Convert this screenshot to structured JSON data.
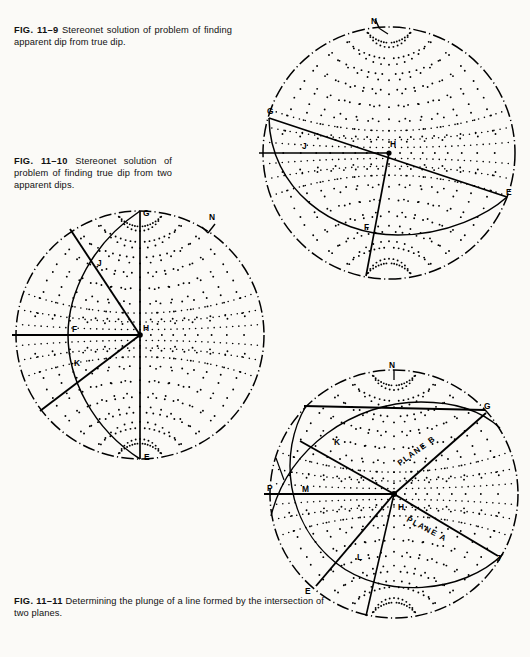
{
  "page": {
    "background": "#fbfaf7",
    "ink": "#111111",
    "width": 530,
    "height": 657
  },
  "captions": [
    {
      "id": "cap-11-9",
      "figure_number": "FIG. 11–9",
      "text": "Stereonet solution of problem of finding apparent dip from true dip."
    },
    {
      "id": "cap-11-10",
      "figure_number": "FIG. 11–10",
      "text": "Stereonet solution of problem of finding true dip from two apparent dips."
    },
    {
      "id": "cap-11-11",
      "figure_number": "FIG. 11–11",
      "text": "Determining the plunge of a line formed by the intersection of two planes."
    }
  ],
  "figures": [
    {
      "id": "net-top",
      "name": "stereonet-apparent-dip",
      "caption_ref": "FIG. 11–9",
      "compass_label": "N",
      "point_labels": [
        "G",
        "J",
        "H",
        "E",
        "F"
      ],
      "description": "Wulff stereonet with great circle from G through F to E, radius H-J horizontal, and line H-F plotted."
    },
    {
      "id": "net-mid",
      "name": "stereonet-true-dip",
      "caption_ref": "FIG. 11–10",
      "compass_label": "N",
      "point_labels": [
        "G",
        "J",
        "F",
        "H",
        "K",
        "E"
      ],
      "description": "Wulff stereonet with vertical diameter G-E, horizontal radius F-H, great circle through G, J, K, E and two apparent dip rays."
    },
    {
      "id": "net-bot",
      "name": "stereonet-plane-intersection",
      "caption_ref": "FIG. 11–11",
      "compass_label": "N",
      "point_labels": [
        "G",
        "K",
        "P",
        "M",
        "H",
        "L",
        "E",
        "J"
      ],
      "plane_labels": [
        "PLANE A",
        "PLANE B"
      ],
      "description": "Wulff stereonet showing two intersecting great circles (Plane A and Plane B) and the plunge of their line of intersection."
    }
  ],
  "chart_data": {
    "type": "scatter",
    "projection": "lower-hemisphere equal-angle",
    "grid": "polar great-circle / small-circle net, 10° spacing, rendered as dotted lattice",
    "legend_position": "none",
    "nets": [
      {
        "id": "net-top",
        "center": [
          131,
          139
        ],
        "radius": 126,
        "primitive": "dash-dot circle",
        "labels": [
          {
            "text": "N",
            "angle_deg": -27,
            "note": "north tick on primitive, upper-left"
          },
          {
            "text": "G",
            "x": 12,
            "y": 100
          },
          {
            "text": "J",
            "x": 48,
            "y": 137
          },
          {
            "text": "H",
            "x": 133,
            "y": 134
          },
          {
            "text": "E",
            "x": 249,
            "y": 182
          },
          {
            "text": "F",
            "x": 112,
            "y": 218
          }
        ]
      },
      {
        "id": "net-mid",
        "center": [
          128,
          137
        ],
        "radius": 124,
        "primitive": "dash-dot circle",
        "labels": [
          {
            "text": "G",
            "x": 130,
            "y": 16
          },
          {
            "text": "N",
            "x": 196,
            "y": 20
          },
          {
            "text": "J",
            "x": 90,
            "y": 66
          },
          {
            "text": "F",
            "x": 63,
            "y": 131
          },
          {
            "text": "H",
            "x": 132,
            "y": 129
          },
          {
            "text": "K",
            "x": 65,
            "y": 165
          },
          {
            "text": "E",
            "x": 131,
            "y": 258
          }
        ]
      },
      {
        "id": "net-bot",
        "center": [
          136,
          136
        ],
        "radius": 124,
        "primitive": "dash-dot circle",
        "labels": [
          {
            "text": "N",
            "x": 128,
            "y": 8
          },
          {
            "text": "G",
            "x": 221,
            "y": 50
          },
          {
            "text": "K",
            "x": 80,
            "y": 84
          },
          {
            "text": "P",
            "x": 12,
            "y": 131
          },
          {
            "text": "M",
            "x": 47,
            "y": 133
          },
          {
            "text": "H",
            "x": 143,
            "y": 148
          },
          {
            "text": "L",
            "x": 102,
            "y": 198
          },
          {
            "text": "E",
            "x": 50,
            "y": 230
          },
          {
            "text": "J",
            "x": 236,
            "y": 199
          },
          {
            "text": "PLANE B",
            "x": 150,
            "y": 102,
            "rotate": -35
          },
          {
            "text": "PLANE A",
            "x": 155,
            "y": 160,
            "rotate": 25
          }
        ]
      }
    ]
  }
}
